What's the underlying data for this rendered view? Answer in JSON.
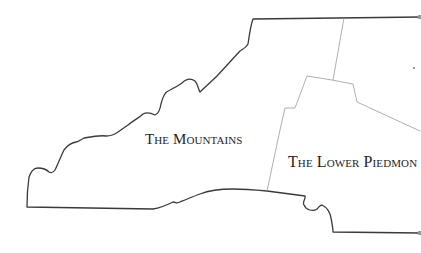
{
  "map": {
    "regions": [
      {
        "id": "mountains",
        "label": "The Mountains"
      },
      {
        "id": "lower-piedmont",
        "label": "The Lower Piedmon"
      }
    ],
    "colors": {
      "outline": "#3a3a3a",
      "inner_border": "#9a9a9a",
      "label": "#1e1e1e",
      "background": "#ffffff"
    }
  }
}
